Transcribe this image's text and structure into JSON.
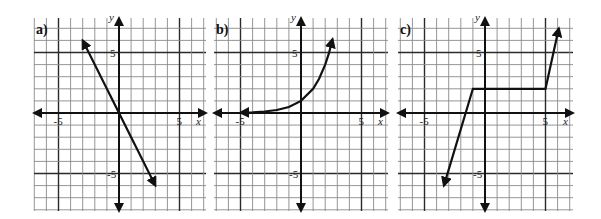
{
  "figure": {
    "unit_px": 12.1,
    "panels": [
      {
        "label": "a)",
        "origin": [
          119,
          113
        ],
        "left": 34,
        "right": 206,
        "top": 18,
        "bottom": 211,
        "x_axis_label": "x",
        "y_axis_label": "y",
        "tick_labels": {
          "x_neg": "-5",
          "x_pos": "5",
          "y_pos": "5",
          "y_neg": "-5"
        },
        "graph": {
          "type": "line",
          "description": "straight line through origin, slope -2",
          "points": [
            [
              -3,
              6
            ],
            [
              3,
              -6
            ]
          ],
          "arrows": "both"
        }
      },
      {
        "label": "b)",
        "origin": [
          301,
          113
        ],
        "left": 214,
        "right": 388,
        "top": 18,
        "bottom": 211,
        "x_axis_label": "x",
        "y_axis_label": "y",
        "tick_labels": {
          "x_neg": "-5",
          "x_pos": "5",
          "y_pos": "5",
          "y_neg": "-5"
        },
        "graph": {
          "type": "exponential",
          "description": "increasing exponential curve, asymptote y=0 on left, passes (0,1)",
          "points": [
            [
              -5,
              0.03
            ],
            [
              -4,
              0.06
            ],
            [
              -3,
              0.125
            ],
            [
              -2,
              0.25
            ],
            [
              -1,
              0.5
            ],
            [
              0,
              1
            ],
            [
              1,
              2
            ],
            [
              1.5,
              2.83
            ],
            [
              2,
              4
            ],
            [
              2.3,
              4.9
            ],
            [
              2.6,
              6.1
            ]
          ],
          "arrows": "both"
        }
      },
      {
        "label": "c)",
        "origin": [
          485,
          113
        ],
        "left": 398,
        "right": 573,
        "top": 18,
        "bottom": 211,
        "x_axis_label": "x",
        "y_axis_label": "y",
        "tick_labels": {
          "x_neg": "-5",
          "x_pos": "5",
          "y_pos": "5",
          "y_neg": "-5"
        },
        "graph": {
          "type": "piecewise",
          "description": "rises steeply to (-1,2), constant y=2 until x=5, then rises steeply",
          "points": [
            [
              -3.4,
              -6
            ],
            [
              -1,
              2
            ],
            [
              5,
              2
            ],
            [
              6.1,
              7
            ]
          ],
          "arrows": "both"
        }
      }
    ]
  }
}
